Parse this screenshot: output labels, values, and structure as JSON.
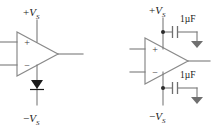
{
  "figure": {
    "background_color": "#ffffff",
    "wire_color": "#7a7a7a",
    "label_color": "#1a1a1a"
  },
  "circuits": [
    {
      "id": "left",
      "name": "opamp-with-diode",
      "opamp": {
        "name": "operational-amplifier",
        "noninverting_pin_label": "+",
        "inverting_pin_label": "−",
        "has_output_wire": true,
        "has_positive_supply_pin": true,
        "has_negative_supply_pin": true
      },
      "supplies": {
        "positive": {
          "sign": "+",
          "symbol": "V",
          "subscript": "S"
        },
        "negative": {
          "sign": "−",
          "symbol": "V",
          "subscript": "S"
        }
      },
      "components": [
        {
          "type": "diode",
          "name": "diode",
          "orientation": "cathode-down",
          "on_rail": "negative"
        }
      ],
      "capacitors": []
    },
    {
      "id": "right",
      "name": "opamp-with-bypass-capacitors",
      "opamp": {
        "name": "operational-amplifier",
        "noninverting_pin_label": "+",
        "inverting_pin_label": "−",
        "has_output_wire": true,
        "has_positive_supply_pin": true,
        "has_negative_supply_pin": true
      },
      "supplies": {
        "positive": {
          "sign": "+",
          "symbol": "V",
          "subscript": "S"
        },
        "negative": {
          "sign": "−",
          "symbol": "V",
          "subscript": "S"
        }
      },
      "components": [
        {
          "type": "ground",
          "name": "ground-top",
          "rail": "positive"
        },
        {
          "type": "ground",
          "name": "ground-bottom",
          "rail": "negative"
        }
      ],
      "capacitors": [
        {
          "name": "bypass-capacitor-top",
          "value": "1µF",
          "rail": "positive",
          "connects_to": "ground"
        },
        {
          "name": "bypass-capacitor-bottom",
          "value": "1µF",
          "rail": "negative",
          "connects_to": "ground"
        }
      ]
    }
  ]
}
